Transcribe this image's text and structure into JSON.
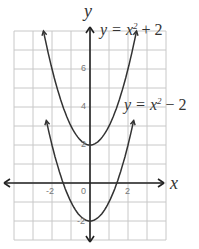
{
  "chart_data": {
    "type": "line",
    "title": "",
    "xlabel": "x",
    "ylabel": "y",
    "xlim": [
      -4,
      4
    ],
    "ylim": [
      -3,
      8
    ],
    "grid": true,
    "x_ticks": [
      "-2",
      "0",
      "2"
    ],
    "y_ticks": [
      "6",
      "4",
      "2",
      "-2"
    ],
    "series": [
      {
        "name": "y = x^2 + 2",
        "label_prefix": "y = x",
        "label_sup": "2",
        "label_suffix": " + 2",
        "x": [
          -2.45,
          -2,
          -1,
          0,
          1,
          2,
          2.45
        ],
        "y": [
          8,
          6,
          3,
          2,
          3,
          6,
          8
        ]
      },
      {
        "name": "y = x^2 - 2",
        "label_prefix": "y = x",
        "label_sup": "2",
        "label_suffix": " − 2",
        "x": [
          -2.3,
          -2,
          -1,
          0,
          1,
          2,
          2.3
        ],
        "y": [
          3.3,
          2,
          -1,
          -2,
          -1,
          2,
          3.3
        ]
      }
    ],
    "colors": {
      "curve": "#333333",
      "grid": "#c8c8c8",
      "axis": "#222222"
    }
  }
}
